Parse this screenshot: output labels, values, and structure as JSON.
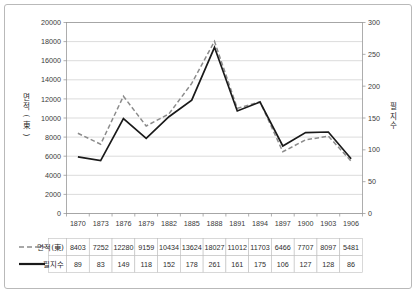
{
  "chart_data": {
    "type": "line",
    "title": "",
    "xlabel": "",
    "categories": [
      "1870",
      "1873",
      "1876",
      "1879",
      "1882",
      "1885",
      "1888",
      "1891",
      "1894",
      "1897",
      "1900",
      "1903",
      "1906"
    ],
    "grid": true,
    "legend_position": "bottom-table",
    "series": [
      {
        "name": "면적(東)",
        "axis": "left",
        "style": "dashed",
        "color": "#8c8c8c",
        "values": [
          8403,
          7252,
          12280,
          9159,
          10434,
          13624,
          18027,
          11012,
          11703,
          6466,
          7707,
          8097,
          5481
        ]
      },
      {
        "name": "필지수",
        "axis": "right",
        "style": "solid",
        "color": "#1a1a1a",
        "values": [
          89,
          83,
          149,
          118,
          152,
          178,
          261,
          161,
          175,
          106,
          127,
          128,
          86
        ]
      }
    ],
    "left_axis": {
      "title": "면적(東)",
      "title_chars": [
        "면",
        "적",
        "(",
        "東",
        ")"
      ],
      "ylim": [
        0,
        20000
      ],
      "ticks": [
        "0",
        "2000",
        "4000",
        "6000",
        "8000",
        "10000",
        "12000",
        "14000",
        "16000",
        "18000",
        "20000"
      ]
    },
    "right_axis": {
      "title": "필지수",
      "title_chars": [
        "필",
        "지",
        "수"
      ],
      "ylim": [
        0,
        300
      ],
      "ticks": [
        "0",
        "50",
        "100",
        "150",
        "200",
        "250",
        "300"
      ]
    },
    "data_table": {
      "row_labels": [
        "면적(東)",
        "필지수"
      ],
      "columns": [
        "1870",
        "1873",
        "1876",
        "1879",
        "1882",
        "1885",
        "1888",
        "1891",
        "1894",
        "1897",
        "1900",
        "1903",
        "1906"
      ],
      "rows": [
        [
          "8403",
          "7252",
          "12280",
          "9159",
          "10434",
          "13624",
          "18027",
          "11012",
          "11703",
          "6466",
          "7707",
          "8097",
          "5481"
        ],
        [
          "89",
          "83",
          "149",
          "118",
          "152",
          "178",
          "261",
          "161",
          "175",
          "106",
          "127",
          "128",
          "86"
        ]
      ]
    }
  }
}
